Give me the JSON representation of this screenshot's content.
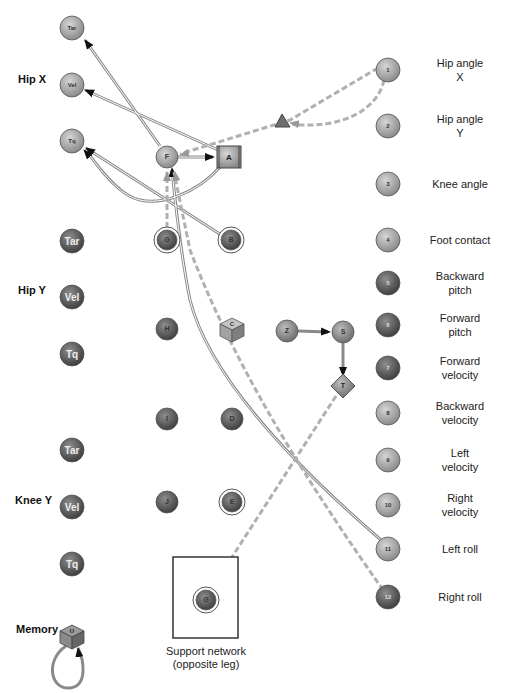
{
  "groups": [
    {
      "label": "Hip X",
      "x": 18,
      "y": 80
    },
    {
      "label": "Hip Y",
      "x": 18,
      "y": 291
    },
    {
      "label": "Knee Y",
      "x": 15,
      "y": 501
    },
    {
      "label": "Memory",
      "x": 16,
      "y": 630
    }
  ],
  "motor_nodes": [
    {
      "id": "hipx-tar",
      "label": "Tar",
      "x": 72,
      "y": 28,
      "shade": "light"
    },
    {
      "id": "hipx-vel",
      "label": "Vel",
      "x": 72,
      "y": 85,
      "shade": "light"
    },
    {
      "id": "hipx-tq",
      "label": "Tq",
      "x": 72,
      "y": 141,
      "shade": "light"
    },
    {
      "id": "hipy-tar",
      "label": "Tar",
      "x": 72,
      "y": 241,
      "shade": "dark"
    },
    {
      "id": "hipy-vel",
      "label": "Vel",
      "x": 72,
      "y": 297,
      "shade": "dark"
    },
    {
      "id": "hipy-tq",
      "label": "Tq",
      "x": 72,
      "y": 354,
      "shade": "dark"
    },
    {
      "id": "knee-tar",
      "label": "Tar",
      "x": 72,
      "y": 450,
      "shade": "dark"
    },
    {
      "id": "knee-vel",
      "label": "Vel",
      "x": 72,
      "y": 507,
      "shade": "dark"
    },
    {
      "id": "knee-tq",
      "label": "Tq",
      "x": 72,
      "y": 564,
      "shade": "dark"
    }
  ],
  "inner_nodes": [
    {
      "label": "F",
      "x": 167,
      "y": 157,
      "shape": "circle",
      "shade": "light"
    },
    {
      "label": "A",
      "x": 229,
      "y": 157,
      "shape": "square",
      "shade": "mid"
    },
    {
      "label": "G",
      "x": 167,
      "y": 240,
      "shape": "ring",
      "shade": "dark"
    },
    {
      "label": "B",
      "x": 231,
      "y": 240,
      "shape": "ring",
      "shade": "dark"
    },
    {
      "label": "H",
      "x": 167,
      "y": 329,
      "shape": "circle",
      "shade": "dark"
    },
    {
      "label": "C",
      "x": 232,
      "y": 329,
      "shape": "cube",
      "shade": "mid"
    },
    {
      "label": "Z",
      "x": 287,
      "y": 331,
      "shape": "circle",
      "shade": "mid"
    },
    {
      "label": "S",
      "x": 343,
      "y": 332,
      "shape": "circle",
      "shade": "mid"
    },
    {
      "label": "T",
      "x": 343,
      "y": 386,
      "shape": "diamond",
      "shade": "mid"
    },
    {
      "label": "I",
      "x": 167,
      "y": 419,
      "shape": "circle",
      "shade": "dark"
    },
    {
      "label": "D",
      "x": 232,
      "y": 419,
      "shape": "circle",
      "shade": "dark"
    },
    {
      "label": "J",
      "x": 167,
      "y": 502,
      "shape": "circle",
      "shade": "dark"
    },
    {
      "label": "E",
      "x": 232,
      "y": 502,
      "shape": "ring",
      "shade": "dark"
    }
  ],
  "sensors": [
    {
      "num": "1",
      "label": "Hip angle X",
      "y": 70,
      "shade": "light"
    },
    {
      "num": "2",
      "label": "Hip angle Y",
      "y": 126,
      "shade": "light"
    },
    {
      "num": "3",
      "label": "Knee angle",
      "y": 184,
      "shade": "light"
    },
    {
      "num": "4",
      "label": "Foot contact",
      "y": 240,
      "shade": "light"
    },
    {
      "num": "5",
      "label": "Backward pitch",
      "y": 283,
      "shade": "dark"
    },
    {
      "num": "6",
      "label": "Forward pitch",
      "y": 325,
      "shade": "dark"
    },
    {
      "num": "7",
      "label": "Forward velocity",
      "y": 368,
      "shade": "dark"
    },
    {
      "num": "8",
      "label": "Backward velocity",
      "y": 413,
      "shade": "light"
    },
    {
      "num": "9",
      "label": "Left velocity",
      "y": 460,
      "shade": "light"
    },
    {
      "num": "10",
      "label": "Right velocity",
      "y": 505,
      "shade": "light"
    },
    {
      "num": "11",
      "label": "Left roll",
      "y": 549,
      "shade": "light"
    },
    {
      "num": "12",
      "label": "Right roll",
      "y": 597,
      "shade": "dark"
    }
  ],
  "sensor_labels": [
    {
      "l1": "Hip angle",
      "l2": "X",
      "y": 70
    },
    {
      "l1": "Hip angle",
      "l2": "Y",
      "y": 126
    },
    {
      "l1": "Knee angle",
      "l2": "",
      "y": 184
    },
    {
      "l1": "Foot contact",
      "l2": "",
      "y": 240
    },
    {
      "l1": "Backward",
      "l2": "pitch",
      "y": 283
    },
    {
      "l1": "Forward",
      "l2": "pitch",
      "y": 325
    },
    {
      "l1": "Forward",
      "l2": "velocity",
      "y": 368
    },
    {
      "l1": "Backward",
      "l2": "velocity",
      "y": 413
    },
    {
      "l1": "Left",
      "l2": "velocity",
      "y": 460
    },
    {
      "l1": "Right",
      "l2": "velocity",
      "y": 505
    },
    {
      "l1": "Left roll",
      "l2": "",
      "y": 549
    },
    {
      "l1": "Right roll",
      "l2": "",
      "y": 597
    }
  ],
  "support": {
    "node_label": "G",
    "caption_line1": "Support network",
    "caption_line2": "(opposite leg)"
  },
  "memory": {
    "cube_label": "U"
  },
  "colors": {
    "light": "#a8a8a8",
    "mid": "#8c8c8c",
    "dark": "#5a5a5a",
    "edge": "#8a8a8a",
    "dashed": "#b0b0b0"
  }
}
